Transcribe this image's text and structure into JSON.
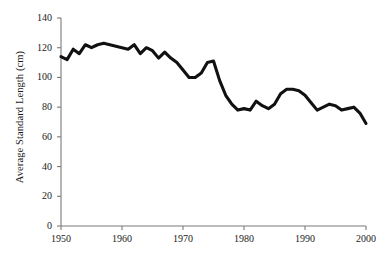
{
  "chart_data": {
    "type": "line",
    "title": "",
    "xlabel": "",
    "ylabel": "Average Standard Length (cm)",
    "xlim": [
      1950,
      2000
    ],
    "ylim": [
      0,
      140
    ],
    "grid": false,
    "legend": null,
    "line_color": "#111111",
    "axis_color": "#7a7a7a",
    "x_ticks": [
      1950,
      1960,
      1970,
      1980,
      1990,
      2000
    ],
    "x_tick_labels": [
      "1950",
      "1960",
      "1970",
      "1980",
      "1990",
      "2000"
    ],
    "y_ticks": [
      0,
      20,
      40,
      60,
      80,
      100,
      120,
      140
    ],
    "y_tick_labels": [
      "0",
      "20",
      "40",
      "60",
      "80",
      "100",
      "120",
      "140"
    ],
    "series": [
      {
        "name": "Average Standard Length",
        "x": [
          1950,
          1951,
          1952,
          1953,
          1954,
          1955,
          1956,
          1957,
          1958,
          1959,
          1960,
          1961,
          1962,
          1963,
          1964,
          1965,
          1966,
          1967,
          1968,
          1969,
          1970,
          1971,
          1972,
          1973,
          1974,
          1975,
          1976,
          1977,
          1978,
          1979,
          1980,
          1981,
          1982,
          1983,
          1984,
          1985,
          1986,
          1987,
          1988,
          1989,
          1990,
          1991,
          1992,
          1993,
          1994,
          1995,
          1996,
          1997,
          1998,
          1999,
          2000
        ],
        "values": [
          114,
          112,
          119,
          116,
          122,
          120,
          122,
          123,
          122,
          121,
          120,
          119,
          122,
          116,
          120,
          118,
          113,
          117,
          113,
          110,
          105,
          100,
          100,
          103,
          110,
          111,
          98,
          88,
          82,
          78,
          79,
          78,
          84,
          81,
          79,
          82,
          89,
          92,
          92,
          91,
          88,
          83,
          78,
          80,
          82,
          81,
          78,
          79,
          80,
          76,
          69
        ]
      }
    ]
  },
  "axes": {
    "y_label": "Average Standard Length (cm)"
  }
}
